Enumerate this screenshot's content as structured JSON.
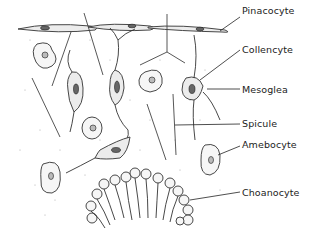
{
  "figure": {
    "labels": [
      {
        "id": "pinacocyte",
        "text": "Pinacocyte",
        "x": 242,
        "y": 11
      },
      {
        "id": "collencyte",
        "text": "Collencyte",
        "x": 242,
        "y": 44
      },
      {
        "id": "mesoglea",
        "text": "Mesoglea",
        "x": 242,
        "y": 84
      },
      {
        "id": "spicule",
        "text": "Spicule",
        "x": 242,
        "y": 118
      },
      {
        "id": "amebocyte",
        "text": "Amebocyte",
        "x": 242,
        "y": 139
      },
      {
        "id": "choanocyte",
        "text": "Choanocyte",
        "x": 242,
        "y": 187
      }
    ],
    "colors": {
      "ink": "#333333",
      "background": "#ffffff",
      "stipple": "#999999"
    }
  }
}
